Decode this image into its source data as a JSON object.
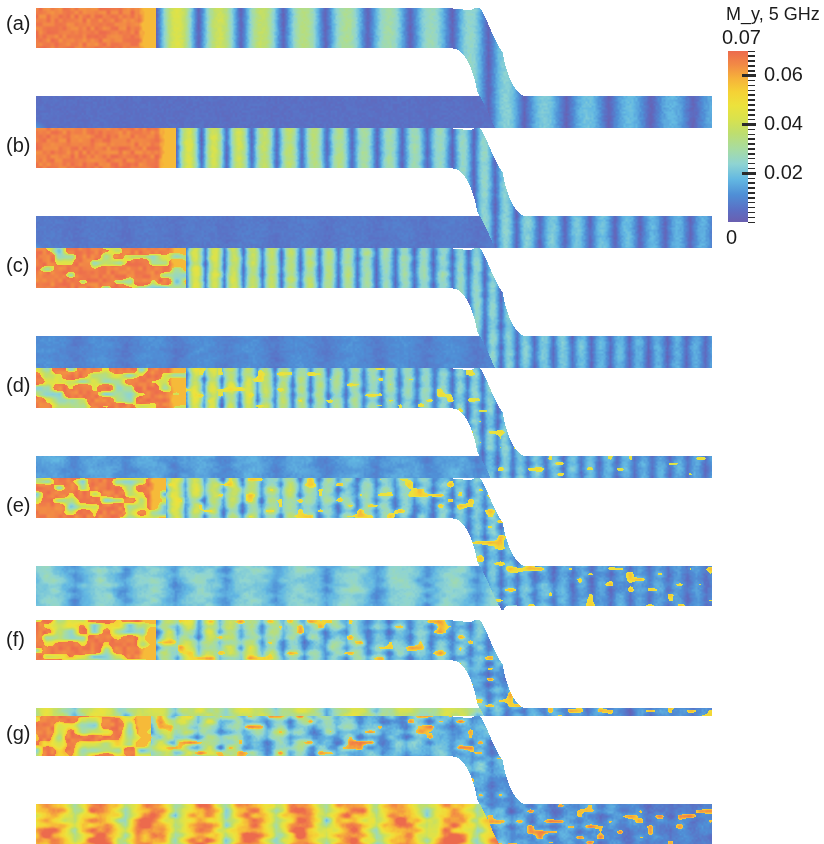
{
  "figure": {
    "background": "#ffffff",
    "width": 824,
    "height": 844
  },
  "colorbar": {
    "title": "M_y, 5 GHz",
    "max_label": "0.07",
    "min_label": "0",
    "tick_labels": [
      "0.06",
      "0.04",
      "0.02"
    ],
    "tick_values": [
      0.06,
      0.04,
      0.02
    ],
    "range": [
      0,
      0.07
    ],
    "quantity": "M_y",
    "frequency": "5 GHz",
    "colors": {
      "low": "#6a5fb0",
      "mid_low": "#63b8e2",
      "mid": "#a8dca0",
      "mid_high": "#ece23c",
      "high": "#ec6a4d"
    },
    "minor_tick_count": 35
  },
  "panels": [
    {
      "id": "a",
      "label": "(a)"
    },
    {
      "id": "b",
      "label": "(b)"
    },
    {
      "id": "c",
      "label": "(c)"
    },
    {
      "id": "d",
      "label": "(d)"
    },
    {
      "id": "e",
      "label": "(e)"
    },
    {
      "id": "f",
      "label": "(f)"
    },
    {
      "id": "g",
      "label": "(g)"
    }
  ],
  "chart_data": {
    "type": "heatmap",
    "title": "M_y, 5 GHz",
    "colorbar_label": "M_y",
    "colorbar_range": [
      0,
      0.07
    ],
    "colorbar_ticks": [
      0,
      0.02,
      0.04,
      0.06,
      0.07
    ],
    "grid": false,
    "legend_position": "right",
    "panel_count": 7,
    "panel_labels": [
      "(a)",
      "(b)",
      "(c)",
      "(d)",
      "(e)",
      "(f)",
      "(g)"
    ],
    "xlabel": "",
    "ylabel": "",
    "series": [
      {
        "name": "(a)",
        "excitation_extent_px": 120,
        "peak_amplitude": 0.07,
        "stripe_count": 7,
        "lower_guide_amplitude": 0.006,
        "turbulence": 0.05,
        "seed": 11
      },
      {
        "name": "(b)",
        "excitation_extent_px": 140,
        "peak_amplitude": 0.07,
        "stripe_count": 11,
        "lower_guide_amplitude": 0.007,
        "turbulence": 0.15,
        "seed": 23
      },
      {
        "name": "(c)",
        "excitation_extent_px": 150,
        "peak_amplitude": 0.07,
        "stripe_count": 14,
        "lower_guide_amplitude": 0.008,
        "turbulence": 0.3,
        "seed": 37
      },
      {
        "name": "(d)",
        "excitation_extent_px": 150,
        "peak_amplitude": 0.07,
        "stripe_count": 15,
        "lower_guide_amplitude": 0.009,
        "turbulence": 0.45,
        "seed": 53
      },
      {
        "name": "(e)",
        "excitation_extent_px": 130,
        "peak_amplitude": 0.07,
        "stripe_count": 15,
        "lower_guide_amplitude": 0.012,
        "turbulence": 0.62,
        "seed": 71
      },
      {
        "name": "(f)",
        "excitation_extent_px": 120,
        "peak_amplitude": 0.07,
        "stripe_count": 14,
        "lower_guide_amplitude": 0.018,
        "turbulence": 0.78,
        "seed": 89
      },
      {
        "name": "(g)",
        "excitation_extent_px": 115,
        "peak_amplitude": 0.07,
        "stripe_count": 13,
        "lower_guide_amplitude": 0.024,
        "turbulence": 0.95,
        "seed": 107
      }
    ]
  },
  "geometry": {
    "guide_left_px": 36,
    "guide_right_px": 711,
    "guide_thickness_px": 40,
    "bend_start_px": 452,
    "bend_end_px": 527,
    "panel_tops": [
      8,
      128,
      248,
      368,
      478,
      620,
      716
    ],
    "label_x_px": 6,
    "label_offsets_y": [
      18,
      20,
      20,
      20,
      30,
      22,
      20
    ]
  }
}
